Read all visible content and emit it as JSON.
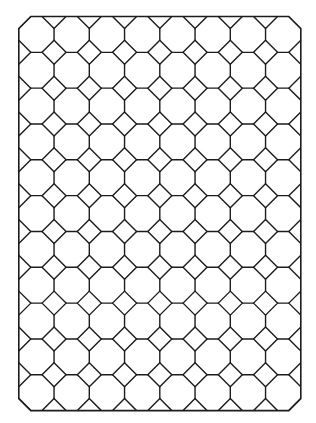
{
  "page": {
    "background": "#ffffff"
  },
  "pattern": {
    "description": "Octagon and square (truncated square) tiling inside a chamfered rectangular frame",
    "columns": 8,
    "rows": 11,
    "octagon_count": 88,
    "line_color": "#1c1c1c",
    "fill_color": "#ffffff"
  }
}
